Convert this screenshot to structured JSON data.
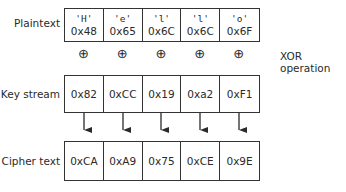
{
  "rows": {
    "plaintext": {
      "label": "Plaintext",
      "chars": [
        "'H'",
        "'e'",
        "'l'",
        "'l'",
        "'o'"
      ],
      "hex": [
        "0x48",
        "0x65",
        "0x6C",
        "0x6C",
        "0x6F"
      ]
    },
    "keystream": {
      "label": "Key stream",
      "hex": [
        "0x82",
        "0xCC",
        "0x19",
        "0xa2",
        "0xF1"
      ]
    },
    "ciphertext": {
      "label": "Cipher text",
      "hex": [
        "0xCA",
        "0xA9",
        "0x75",
        "0xCE",
        "0x9E"
      ]
    }
  },
  "operation": {
    "symbol": "⊕",
    "label": "XOR operation"
  }
}
